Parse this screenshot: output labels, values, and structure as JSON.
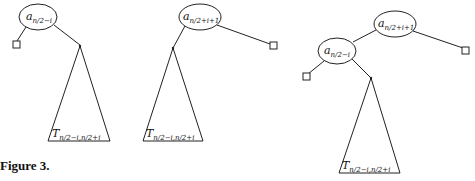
{
  "figure": {
    "caption": "Figure 3.",
    "trees": [
      {
        "root_label": "a",
        "root_sub": "n/2−i",
        "subtree_label": "T",
        "subtree_sub": "n/2−i,n/2+i"
      },
      {
        "root_label": "a",
        "root_sub": "n/2+i+1",
        "subtree_label": "T",
        "subtree_sub": "n/2−i,n/2+i"
      },
      {
        "root_label": "a",
        "root_sub": "n/2+i+1",
        "child_label": "a",
        "child_sub": "n/2−i",
        "subtree_label": "T",
        "subtree_sub": "n/2−i,n/2+i"
      }
    ]
  }
}
